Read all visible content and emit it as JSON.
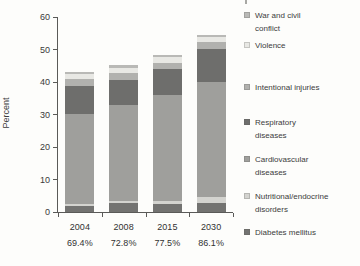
{
  "chart_data": {
    "type": "bar",
    "stacked": true,
    "title": "",
    "xlabel": "",
    "ylabel": "Percent",
    "ylim": [
      0,
      60
    ],
    "yticks": [
      0,
      10,
      20,
      30,
      40,
      50,
      60
    ],
    "grid": false,
    "categories": [
      "2004",
      "2008",
      "2015",
      "2030"
    ],
    "category_sublabels": [
      "69.4%",
      "72.8%",
      "77.5%",
      "86.1%"
    ],
    "series_bottom_to_top": [
      {
        "name": "Diabetes mellitus",
        "color": "#737371",
        "values": [
          1.7,
          2.7,
          2.5,
          2.9
        ]
      },
      {
        "name": "Nutritional/endocrine disorders",
        "color": "#d3d3cf",
        "values": [
          0.9,
          0.8,
          1.0,
          1.6
        ]
      },
      {
        "name": "Cardiovascular diseases",
        "color": "#9f9f9c",
        "values": [
          27.6,
          29.5,
          32.5,
          35.6
        ]
      },
      {
        "name": "Respiratory diseases",
        "color": "#6e6e6c",
        "values": [
          8.7,
          7.5,
          8.1,
          10.1
        ]
      },
      {
        "name": "Intentional injuries",
        "color": "#b1b1ae",
        "values": [
          2.0,
          2.3,
          1.9,
          2.1
        ]
      },
      {
        "name": "Violence",
        "color": "#e8e8e4",
        "values": [
          1.5,
          1.6,
          1.7,
          1.5
        ]
      },
      {
        "name": "War and civil conflict",
        "color": "#b9b9b6",
        "values": [
          0.6,
          0.9,
          0.6,
          0.7
        ]
      }
    ],
    "bar_totals": [
      43.0,
      45.3,
      48.3,
      54.5
    ],
    "legend": {
      "position": "right",
      "items_top_to_bottom": [
        {
          "label": "War and civil conflict",
          "lines": [
            "War and civil",
            "conflict"
          ]
        },
        {
          "label": "Violence",
          "lines": [
            "Violence"
          ]
        },
        {
          "label": "Intentional injuries",
          "lines": [
            "Intentional injuries"
          ]
        },
        {
          "label": "Respiratory diseases",
          "lines": [
            "Respiratory",
            "diseases"
          ]
        },
        {
          "label": "Cardiovascular diseases",
          "lines": [
            "Cardiovascular",
            "diseases"
          ]
        },
        {
          "label": "Nutritional/endocrine disorders",
          "lines": [
            "Nutritional/endocrine",
            "disorders"
          ]
        },
        {
          "label": "Diabetes mellitus",
          "lines": [
            "Diabetes mellitus"
          ]
        }
      ]
    }
  }
}
